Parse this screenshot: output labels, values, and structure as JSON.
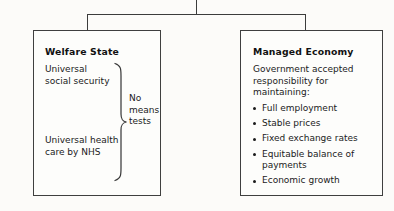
{
  "diagram": {
    "type": "two-branch tree diagram",
    "connector": {
      "stem_label": "",
      "branch_count": 2
    },
    "nodes": [
      {
        "id": "welfare-state",
        "title": "Welfare State",
        "items": [
          "Universal\nsocial security",
          "Universal health\ncare by NHS"
        ],
        "brace_label": "No\nmeans\ntests"
      },
      {
        "id": "managed-economy",
        "title": "Managed Economy",
        "lead": "Government accepted responsibility for maintaining:",
        "bullets": [
          "Full employment",
          "Stable prices",
          "Fixed exchange rates",
          "Equitable balance of payments",
          "Economic growth"
        ]
      }
    ]
  },
  "colors": {
    "page_background": "#fcfbf9",
    "box_border": "#3f3f3f",
    "box_fill": "#fdfdfb",
    "connector_line": "#3c3c3c",
    "text": "#1b1b1b",
    "title_text": "#111111"
  }
}
